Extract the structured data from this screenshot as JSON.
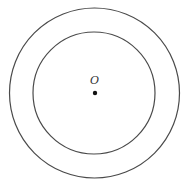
{
  "diagram": {
    "type": "concentric-circles",
    "center_label": "O",
    "colors": {
      "background": "#ffffff",
      "stroke": "#4a4a4a",
      "point": "#111111",
      "label": "#333333"
    },
    "outer_circle": {
      "cx": 94.5,
      "cy": 93,
      "r": 85
    },
    "inner_circle": {
      "cx": 94,
      "cy": 93,
      "r": 61
    },
    "center_point": {
      "cx": 95,
      "cy": 93,
      "r": 2.2
    },
    "label_position": {
      "x": 94.5,
      "y": 84
    }
  }
}
